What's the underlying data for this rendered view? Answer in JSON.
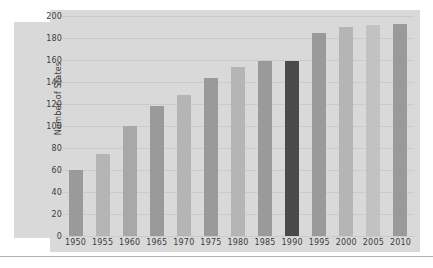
{
  "chart_data": {
    "type": "bar",
    "title": "",
    "subtitle": "",
    "xlabel": "",
    "ylabel": "Number of States",
    "categories": [
      "1950",
      "1955",
      "1960",
      "1965",
      "1970",
      "1975",
      "1980",
      "1985",
      "1990",
      "1995",
      "2000",
      "2005",
      "2010"
    ],
    "values": [
      60,
      75,
      100,
      118,
      128,
      144,
      154,
      159,
      159,
      185,
      190,
      192,
      193
    ],
    "ylim": [
      0,
      200
    ],
    "ytick_labels": [
      "200",
      "180",
      "160",
      "140",
      "120",
      "100",
      "80",
      "60",
      "40",
      "20",
      "0"
    ],
    "ytick_values": [
      200,
      180,
      160,
      140,
      120,
      100,
      80,
      60,
      40,
      20,
      0
    ],
    "grid": true,
    "grid_axis": "y",
    "legend": false,
    "legend_position": "none",
    "highlight_category": "1990",
    "bar_colors": [
      "#9a9a9a",
      "#b5b5b5",
      "#a8a8a8",
      "#9a9a9a",
      "#b5b5b5",
      "#9a9a9a",
      "#b5b5b5",
      "#9a9a9a",
      "#4a4a4a",
      "#9a9a9a",
      "#b5b5b5",
      "#c2c2c2",
      "#9a9a9a"
    ]
  },
  "colors": {
    "panel_background": "#d9d9d9",
    "page_background": "#ffffff",
    "gridline": "#cbcbcb",
    "text": "#3c3c3c",
    "highlight_bar": "#4a4a4a",
    "rule": "#b3b3b3"
  }
}
